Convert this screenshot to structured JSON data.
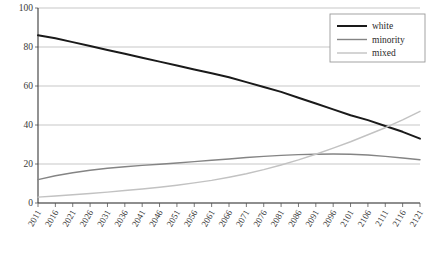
{
  "chart_data": {
    "type": "line",
    "title": "",
    "xlabel": "",
    "ylabel": "",
    "xlim": [
      2011,
      2121
    ],
    "ylim": [
      0,
      100
    ],
    "grid": true,
    "legend_position": "top-right",
    "y_ticks": [
      0,
      20,
      40,
      60,
      80,
      100
    ],
    "y_tick_labels": [
      "0",
      "20",
      "40",
      "60",
      "80",
      "100"
    ],
    "x": [
      2011,
      2016,
      2021,
      2026,
      2031,
      2036,
      2041,
      2046,
      2051,
      2056,
      2061,
      2066,
      2071,
      2076,
      2081,
      2086,
      2091,
      2096,
      2101,
      2106,
      2111,
      2116,
      2121
    ],
    "x_tick_labels": [
      "2011",
      "2016",
      "2021",
      "2026",
      "2031",
      "2036",
      "2041",
      "2046",
      "2051",
      "2056",
      "2061",
      "2066",
      "2071",
      "2076",
      "2081",
      "2086",
      "2091",
      "2096",
      "2101",
      "2106",
      "2111",
      "2116",
      "2121"
    ],
    "series": [
      {
        "name": "white",
        "color": "#1a1a1a",
        "width": 2.0,
        "values": [
          86,
          84.5,
          82.5,
          80.5,
          78.5,
          76.5,
          74.5,
          72.5,
          70.5,
          68.5,
          66.5,
          64.5,
          62,
          59.5,
          57,
          54,
          51,
          48,
          45,
          42.5,
          39.5,
          36.5,
          33
        ]
      },
      {
        "name": "minority",
        "color": "#848484",
        "width": 1.4,
        "values": [
          12,
          14,
          15.5,
          16.8,
          17.8,
          18.6,
          19.3,
          19.9,
          20.5,
          21.2,
          21.9,
          22.6,
          23.3,
          23.9,
          24.4,
          24.8,
          25.0,
          25.1,
          25.0,
          24.6,
          23.9,
          23.1,
          22.2
        ]
      },
      {
        "name": "mixed",
        "color": "#c2c2c2",
        "width": 1.4,
        "values": [
          3,
          3.6,
          4.2,
          4.9,
          5.6,
          6.4,
          7.2,
          8.1,
          9.1,
          10.3,
          11.6,
          13.2,
          15.0,
          17.1,
          19.5,
          22.1,
          25.0,
          28.1,
          31.4,
          35.0,
          38.6,
          42.6,
          47.0
        ]
      }
    ]
  },
  "legend": {
    "items": [
      {
        "label": "white"
      },
      {
        "label": "minority"
      },
      {
        "label": "mixed"
      }
    ]
  }
}
